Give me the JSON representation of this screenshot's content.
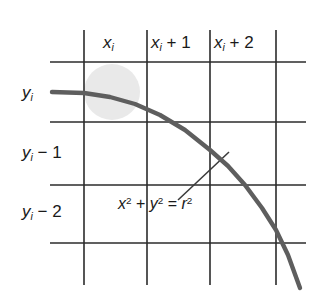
{
  "figure": {
    "kind": "math-diagram",
    "colors": {
      "background": "#ffffff",
      "grid_line": "#2b2b2b",
      "curve": "#5e5e5e",
      "leader_line": "#3a3a3a",
      "highlight_disc": "#e9e9e9",
      "text": "#1a1a1a"
    }
  },
  "column_labels": [
    {
      "id": "x-i",
      "text": "xi",
      "base": "x",
      "subscript": "i",
      "offset": ""
    },
    {
      "id": "x-i-plus-1",
      "text": "xi + 1",
      "base": "x",
      "subscript": "i",
      "offset": " + 1"
    },
    {
      "id": "x-i-plus-2",
      "text": "xi + 2",
      "base": "x",
      "subscript": "i",
      "offset": " + 2"
    }
  ],
  "row_labels": [
    {
      "id": "y-i",
      "text": "yi",
      "base": "y",
      "subscript": "i",
      "offset": ""
    },
    {
      "id": "y-i-minus-1",
      "text": "yi − 1",
      "base": "y",
      "subscript": "i",
      "offset": " − 1"
    },
    {
      "id": "y-i-minus-2",
      "text": "yi − 2",
      "base": "y",
      "subscript": "i",
      "offset": " − 2"
    }
  ],
  "equation": {
    "id": "circle-equation",
    "text": "x2 + y2 = r2",
    "parts": {
      "x": "x",
      "x_exp": "2",
      "plus": " + ",
      "y": "y",
      "y_exp": "2",
      "equals": " = ",
      "r": "r",
      "r_exp": "2"
    }
  },
  "chart_data": {
    "type": "line",
    "title": "",
    "xlabel": "",
    "ylabel": "",
    "grid": true,
    "legend": false,
    "vertical_gridlines_px": [
      84,
      147,
      210,
      276
    ],
    "horizontal_gridlines_px": [
      62,
      122,
      185,
      243
    ],
    "curve_points_px": [
      [
        52,
        92
      ],
      [
        84,
        93
      ],
      [
        110,
        97
      ],
      [
        135,
        104
      ],
      [
        160,
        115
      ],
      [
        185,
        130
      ],
      [
        210,
        150
      ],
      [
        228,
        166
      ],
      [
        245,
        185
      ],
      [
        262,
        208
      ],
      [
        276,
        230
      ],
      [
        288,
        255
      ],
      [
        300,
        288
      ]
    ],
    "leader_line_px": {
      "x1": 178,
      "y1": 200,
      "x2": 229,
      "y2": 152
    },
    "highlight_disc_px": {
      "cx": 112,
      "cy": 92,
      "r": 28
    }
  }
}
